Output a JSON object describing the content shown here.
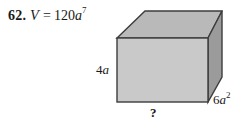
{
  "problem": {
    "number": "62.",
    "variable": "V",
    "equals": "=",
    "coefficient": "120",
    "base": "a",
    "exponent": "7",
    "full_text": "62. V = 120a⁷"
  },
  "figure": {
    "shape_name": "rectangular-prism",
    "labels": {
      "height": "4a",
      "height_coefficient": "4",
      "height_base": "a",
      "depth_coefficient": "6",
      "depth_base": "a",
      "depth_exponent": "2",
      "depth": "6a²",
      "width": "?"
    }
  },
  "colors": {
    "background": "#ffffff",
    "top_face": "#b9b9b9",
    "front_face": "#c9c9c9",
    "side_face": "#9b9b9b",
    "outline": "#3d3d3d",
    "text": "#1a1a1a"
  }
}
